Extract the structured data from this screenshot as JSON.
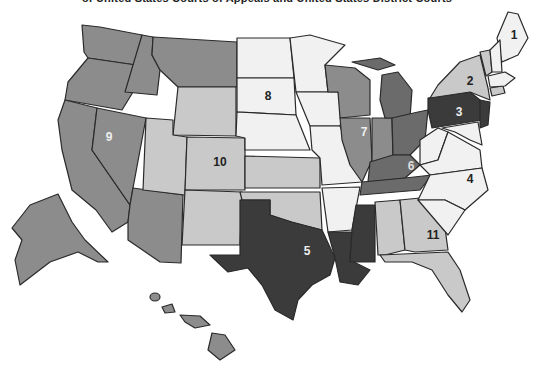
{
  "title": "of United States Courts of Appeals and United States District Courts",
  "colors": {
    "lightest": "#f1f1f1",
    "light": "#c9c9c9",
    "medium": "#8c8c8c",
    "medium_dark": "#6b6b6b",
    "darkest": "#3b3b3b",
    "border": "#2a2a2a",
    "background": "#ffffff"
  },
  "circuits": [
    {
      "number": "1",
      "label": "1",
      "shade": "lightest"
    },
    {
      "number": "2",
      "label": "2",
      "shade": "light"
    },
    {
      "number": "3",
      "label": "3",
      "shade": "darkest"
    },
    {
      "number": "4",
      "label": "4",
      "shade": "lightest"
    },
    {
      "number": "5",
      "label": "5",
      "shade": "darkest"
    },
    {
      "number": "6",
      "label": "6",
      "shade": "medium_dark"
    },
    {
      "number": "7",
      "label": "7",
      "shade": "medium"
    },
    {
      "number": "8",
      "label": "8",
      "shade": "lightest"
    },
    {
      "number": "9",
      "label": "9",
      "shade": "medium"
    },
    {
      "number": "10",
      "label": "10",
      "shade": "light"
    },
    {
      "number": "11",
      "label": "11",
      "shade": "light"
    }
  ]
}
